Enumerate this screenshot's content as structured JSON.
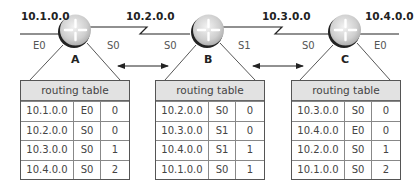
{
  "networks": [
    {
      "id": "net1",
      "label": "10.1.0.0"
    },
    {
      "id": "net2",
      "label": "10.2.0.0"
    },
    {
      "id": "net3",
      "label": "10.3.0.0"
    },
    {
      "id": "net4",
      "label": "10.4.0.0"
    }
  ],
  "routers": [
    {
      "name": "A",
      "interfaces": {
        "left": "E0",
        "right": "S0"
      },
      "routing_table": {
        "title": "routing table",
        "rows": [
          {
            "network": "10.1.0.0",
            "interface": "E0",
            "hops": "0"
          },
          {
            "network": "10.2.0.0",
            "interface": "S0",
            "hops": "0"
          },
          {
            "network": "10.3.0.0",
            "interface": "S0",
            "hops": "1"
          },
          {
            "network": "10.4.0.0",
            "interface": "S0",
            "hops": "2"
          }
        ]
      }
    },
    {
      "name": "B",
      "interfaces": {
        "left": "S0",
        "right": "S1"
      },
      "routing_table": {
        "title": "routing table",
        "rows": [
          {
            "network": "10.2.0.0",
            "interface": "S0",
            "hops": "0"
          },
          {
            "network": "10.3.0.0",
            "interface": "S1",
            "hops": "0"
          },
          {
            "network": "10.4.0.0",
            "interface": "S1",
            "hops": "1"
          },
          {
            "network": "10.1.0.0",
            "interface": "S0",
            "hops": "1"
          }
        ]
      }
    },
    {
      "name": "C",
      "interfaces": {
        "left": "S0",
        "right": "E0"
      },
      "routing_table": {
        "title": "routing table",
        "rows": [
          {
            "network": "10.3.0.0",
            "interface": "S0",
            "hops": "0"
          },
          {
            "network": "10.4.0.0",
            "interface": "E0",
            "hops": "0"
          },
          {
            "network": "10.2.0.0",
            "interface": "S0",
            "hops": "1"
          },
          {
            "network": "10.1.0.0",
            "interface": "S0",
            "hops": "2"
          }
        ]
      }
    }
  ],
  "colors": {
    "line": "#222222",
    "router_fill": "#d8d8d8",
    "router_shadow": "#222222",
    "table_header_bg": "#e2e2e2",
    "table_border": "#555555"
  }
}
